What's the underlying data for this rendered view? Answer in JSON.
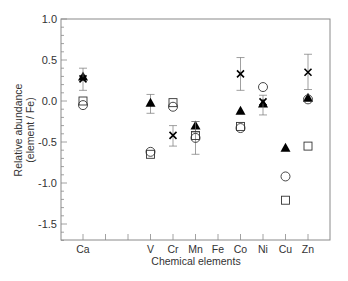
{
  "chart_data": {
    "type": "scatter",
    "title": "",
    "xlabel": "Chemical elements",
    "ylabel": "Relative abundance",
    "ylabel2": "(element / Fe)",
    "ylim": [
      -1.7,
      1.0
    ],
    "yticks": [
      1.0,
      0.5,
      0.0,
      -0.5,
      -1.0,
      -1.5
    ],
    "ytick_labels": [
      "1.0",
      "0.5",
      "0.0",
      "-0.5",
      "-1.0",
      "-1.5"
    ],
    "categories": [
      "Ca",
      "",
      "",
      "V",
      "Cr",
      "Mn",
      "Fe",
      "Co",
      "Ni",
      "Cu",
      "Zn"
    ],
    "grid": false,
    "legend": null,
    "series": [
      {
        "name": "filled triangle",
        "marker": "triangle-filled",
        "points": [
          {
            "x": "Ca",
            "y": 0.3
          },
          {
            "x": "V",
            "y": -0.02,
            "err": [
              -0.15,
              0.08
            ]
          },
          {
            "x": "Mn",
            "y": -0.3,
            "err": [
              -0.38,
              -0.25
            ]
          },
          {
            "x": "Co",
            "y": -0.12
          },
          {
            "x": "Ni",
            "y": -0.03
          },
          {
            "x": "Cu",
            "y": -0.57
          },
          {
            "x": "Zn",
            "y": 0.04
          }
        ]
      },
      {
        "name": "cross",
        "marker": "x",
        "points": [
          {
            "x": "Ca",
            "y": 0.27,
            "err": [
              0.13,
              0.4
            ]
          },
          {
            "x": "Cr",
            "y": -0.42,
            "err": [
              -0.55,
              -0.3
            ]
          },
          {
            "x": "Co",
            "y": 0.33,
            "err": [
              0.13,
              0.53
            ]
          },
          {
            "x": "Ni",
            "y": -0.01,
            "err": [
              -0.17,
              0.07
            ]
          },
          {
            "x": "Zn",
            "y": 0.35,
            "err": [
              0.14,
              0.57
            ]
          }
        ]
      },
      {
        "name": "open square",
        "marker": "square-open",
        "points": [
          {
            "x": "Ca",
            "y": 0.0
          },
          {
            "x": "V",
            "y": -0.65
          },
          {
            "x": "Cr",
            "y": -0.02
          },
          {
            "x": "Mn",
            "y": -0.42,
            "err": [
              -0.65,
              -0.25
            ]
          },
          {
            "x": "Co",
            "y": -0.31
          },
          {
            "x": "Cu",
            "y": -1.21
          },
          {
            "x": "Zn",
            "y": -0.55
          }
        ]
      },
      {
        "name": "open circle",
        "marker": "circle-open",
        "points": [
          {
            "x": "Ca",
            "y": -0.05
          },
          {
            "x": "V",
            "y": -0.62
          },
          {
            "x": "Cr",
            "y": -0.07
          },
          {
            "x": "Mn",
            "y": -0.45
          },
          {
            "x": "Co",
            "y": -0.33
          },
          {
            "x": "Ni",
            "y": 0.17
          },
          {
            "x": "Cu",
            "y": -0.92
          },
          {
            "x": "Zn",
            "y": 0.02
          }
        ]
      }
    ]
  }
}
